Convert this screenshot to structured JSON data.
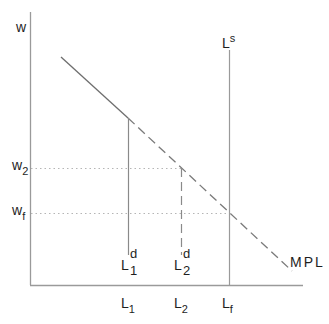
{
  "diagram": {
    "type": "labor-market",
    "axes": {
      "y_label": "w",
      "x_label": "",
      "origin": [
        30,
        285
      ]
    },
    "y_ticks": [
      {
        "base": "w",
        "sub": "2",
        "y": 168
      },
      {
        "base": "w",
        "sub": "f",
        "y": 213
      }
    ],
    "x_ticks": [
      {
        "base": "L",
        "sub": "1",
        "x": 128
      },
      {
        "base": "L",
        "sub": "2",
        "x": 181
      },
      {
        "base": "L",
        "sub": "f",
        "x": 229
      }
    ],
    "curves": {
      "mpl": {
        "label": "MPL",
        "solid_from": [
          61,
          57
        ],
        "solid_to": [
          128,
          118
        ],
        "dashed_to": [
          292,
          271
        ]
      },
      "labor_supply": {
        "base": "L",
        "sup": "s",
        "x": 229,
        "top": 50
      },
      "labor_demand_1": {
        "base": "L",
        "sup": "d",
        "sub": "1",
        "x": 128,
        "top": 118,
        "bottom": 255,
        "style": "solid"
      },
      "labor_demand_2": {
        "base": "L",
        "sup": "d",
        "sub": "2",
        "x": 181,
        "top": 168,
        "bottom": 255,
        "style": "dashed"
      }
    },
    "reference_lines": [
      {
        "name": "w2-line",
        "y": 168,
        "x_to": 181,
        "style": "dotted"
      },
      {
        "name": "wf-line",
        "y": 213,
        "x_to": 229,
        "style": "dotted"
      }
    ],
    "colors": {
      "axis": "#9a9a9a",
      "line": "#7a7a7a",
      "dotted": "#b5b5b5",
      "text": "#1e1e1e"
    }
  }
}
